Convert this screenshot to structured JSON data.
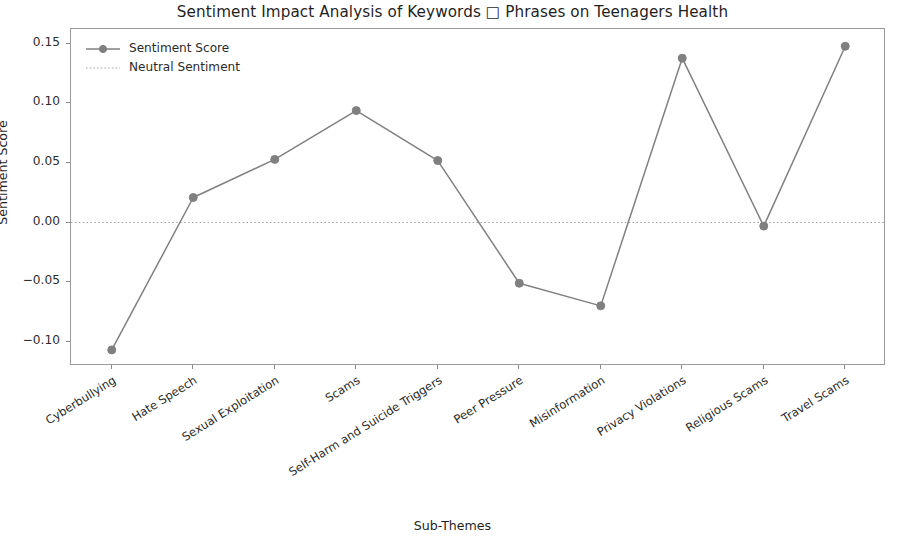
{
  "chart_data": {
    "type": "line",
    "title": "Sentiment Impact Analysis of Keywords □ Phrases on Teenagers Health",
    "xlabel": "Sub-Themes",
    "ylabel": "Sentiment Score",
    "categories": [
      "Cyberbullying",
      "Hate Speech",
      "Sexual Exploitation",
      "Scams",
      "Self-Harm and Suicide Triggers",
      "Peer Pressure",
      "Misinformation",
      "Privacy Violations",
      "Religious Scams",
      "Travel Scams"
    ],
    "series": [
      {
        "name": "Sentiment Score",
        "values": [
          -0.107,
          0.021,
          0.053,
          0.094,
          0.052,
          -0.051,
          -0.07,
          0.138,
          -0.003,
          0.148
        ],
        "color": "#808080",
        "marker": "circle",
        "linestyle": "solid"
      }
    ],
    "reference_lines": [
      {
        "name": "Neutral Sentiment",
        "value": 0.0,
        "color": "#a0a0a0",
        "linestyle": "dotted"
      }
    ],
    "ylim": [
      -0.1205,
      0.1625
    ],
    "yticks": [
      0.15,
      0.1,
      0.05,
      0.0,
      -0.05,
      -0.1
    ],
    "ytick_labels": [
      "0.15",
      "0.10",
      "0.05",
      "0.00",
      "−0.05",
      "−0.10"
    ],
    "grid": false,
    "legend_position": "upper left",
    "legend_entries": [
      "Sentiment Score",
      "Neutral Sentiment"
    ],
    "xtick_rotation": -32,
    "frame_color": "#9a9a9a",
    "background_color": "#ffffff"
  }
}
